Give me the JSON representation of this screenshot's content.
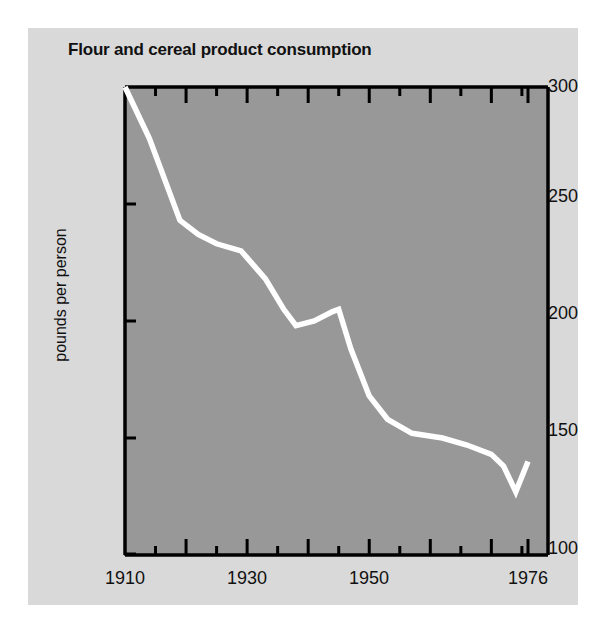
{
  "title": "Flour and cereal product consumption",
  "axes": {
    "ylabel": "pounds per person",
    "ytick_labels": [
      "300",
      "250",
      "200",
      "150",
      "100"
    ],
    "xtick_labels": [
      "1910",
      "1930",
      "1950",
      "1976"
    ]
  },
  "colors": {
    "page_background": "#ffffff",
    "card_background": "#d9d9d9",
    "plot_background": "#989898",
    "line": "#ffffff",
    "axis": "#000000",
    "text": "#111111"
  },
  "chart_data": {
    "type": "line",
    "title": "Flour and cereal product consumption",
    "xlabel": "",
    "ylabel": "pounds per person",
    "xlim": [
      1910,
      1979
    ],
    "ylim": [
      100,
      300
    ],
    "xticks": [
      1910,
      1930,
      1950,
      1976
    ],
    "yticks": [
      100,
      150,
      200,
      250,
      300
    ],
    "grid": false,
    "legend": false,
    "series": [
      {
        "name": "Flour and cereal products",
        "x": [
          1910,
          1914,
          1919,
          1922,
          1925,
          1929,
          1933,
          1936,
          1938,
          1941,
          1944,
          1945,
          1947,
          1950,
          1953,
          1957,
          1962,
          1966,
          1970,
          1972,
          1974,
          1976
        ],
        "values": [
          300,
          278,
          243,
          237,
          233,
          230,
          218,
          205,
          198,
          200,
          204,
          205,
          188,
          168,
          158,
          152,
          150,
          147,
          143,
          138,
          127,
          140
        ]
      }
    ]
  }
}
